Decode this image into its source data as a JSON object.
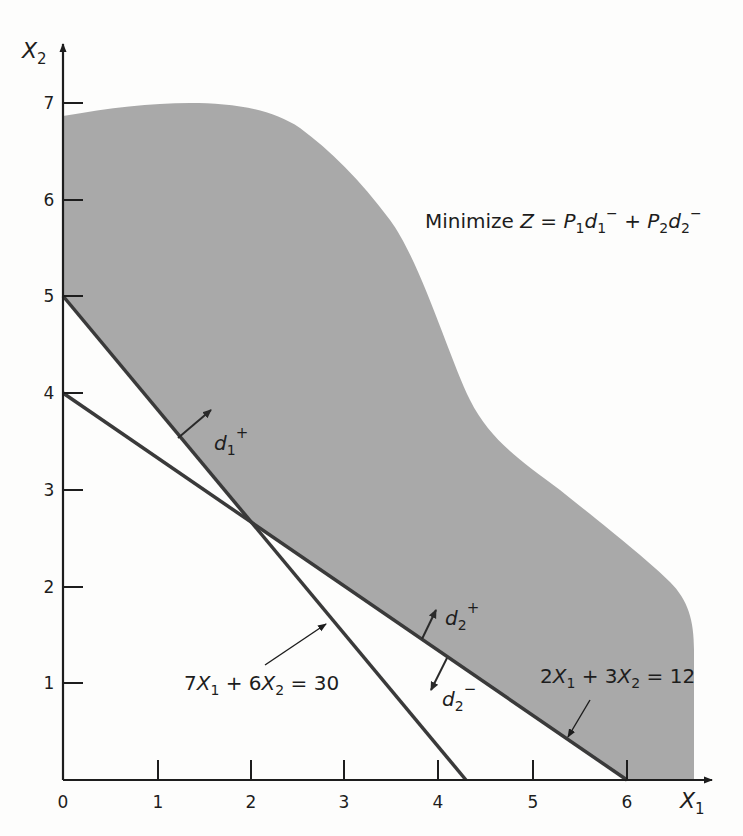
{
  "figure": {
    "objective": {
      "prefix": "Minimize ",
      "Z": "Z",
      "eq": " = ",
      "P1": "P",
      "P1_sub": "1",
      "d1": "d",
      "d1_sub": "1",
      "d1_sup": "−",
      "plus": " + ",
      "P2": "P",
      "P2_sub": "2",
      "d2": "d",
      "d2_sub": "2",
      "d2_sup": "−"
    },
    "axes": {
      "x_label": "X",
      "x_label_sub": "1",
      "y_label": "X",
      "y_label_sub": "2",
      "x_ticks": [
        "0",
        "1",
        "2",
        "3",
        "4",
        "5",
        "6"
      ],
      "y_ticks": [
        "1",
        "2",
        "3",
        "4",
        "5",
        "6",
        "7"
      ]
    },
    "constraints": [
      {
        "label_parts": [
          "7",
          "X",
          "1",
          " + 6",
          "X",
          "2",
          " = 30"
        ],
        "text": "7X1 + 6X2 = 30",
        "x_intercept": 4.2857,
        "y_intercept": 5
      },
      {
        "label_parts": [
          "2",
          "X",
          "1",
          " + 3",
          "X",
          "2",
          " = 12"
        ],
        "text": "2X1 + 3X2 = 12",
        "x_intercept": 6,
        "y_intercept": 4
      }
    ],
    "deviation_labels": {
      "d1_plus": {
        "base": "d",
        "sub": "1",
        "sup": "+"
      },
      "d2_plus": {
        "base": "d",
        "sub": "2",
        "sup": "+"
      },
      "d2_minus": {
        "base": "d",
        "sub": "2",
        "sup": "−"
      }
    },
    "colors": {
      "shaded_region": "#a9a9a9",
      "line": "#3a3a3a",
      "axis": "#1d1d1d",
      "background": "#fdfdfc"
    },
    "intersection": {
      "x1": 2,
      "x2": 2.6667
    }
  }
}
